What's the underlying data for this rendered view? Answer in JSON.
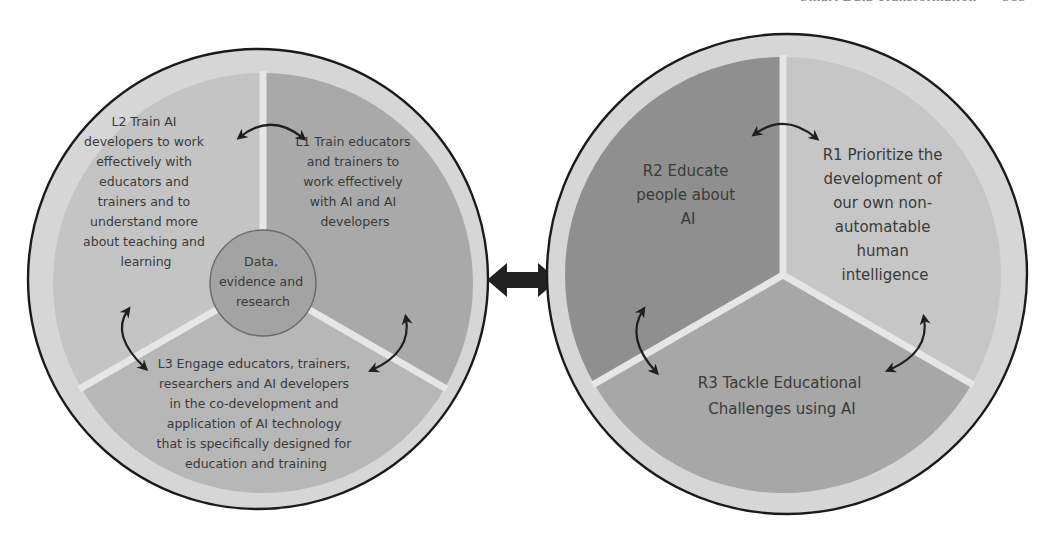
{
  "page_header": {
    "running_title": "Smart Data Transformation",
    "page_number": "315",
    "clipped": true
  },
  "colors": {
    "background": "#ffffff",
    "circle_outline": "#1a1a1a",
    "outer_ring": "#d6d6d6",
    "segment_divider": "#e6e6e6",
    "arrow": "#1f1f1f",
    "text": "#3a3a3a",
    "left_l1": "#a9a9a9",
    "left_l2": "#c4c4c4",
    "left_l3": "#b7b7b7",
    "left_center": "#a3a3a3",
    "right_r1": "#c6c6c6",
    "right_r2": "#8f8f8f",
    "right_r3": "#a7a7a7"
  },
  "left_circle": {
    "segments": [
      {
        "id": "L1",
        "lines": [
          "L1 Train educators",
          "and trainers to",
          "work effectively",
          "with AI and AI",
          "developers"
        ]
      },
      {
        "id": "L2",
        "lines": [
          "L2 Train AI",
          "developers to work",
          "effectively with",
          "educators and",
          "trainers and to",
          "understand more",
          "about teaching and",
          "learning"
        ]
      },
      {
        "id": "L3",
        "lines": [
          "L3 Engage educators, trainers,",
          "researchers and AI developers",
          "in the co-development and",
          "application of AI technology",
          "that is specifically designed for",
          "education and training"
        ]
      }
    ],
    "center": {
      "lines": [
        "Data,",
        "evidence and",
        "research"
      ]
    },
    "arrows": [
      {
        "between": [
          "L2",
          "L1"
        ],
        "direction": "bidirectional"
      },
      {
        "between": [
          "L2",
          "L3"
        ],
        "direction": "bidirectional"
      },
      {
        "between": [
          "L1",
          "L3"
        ],
        "direction": "bidirectional"
      }
    ]
  },
  "connector": {
    "type": "double-headed-arrow",
    "between": [
      "left_circle",
      "right_circle"
    ]
  },
  "right_circle": {
    "segments": [
      {
        "id": "R1",
        "lines": [
          "R1 Prioritize the",
          "development of",
          "our own non-",
          "automatable",
          "human",
          "intelligence"
        ]
      },
      {
        "id": "R2",
        "lines": [
          "R2 Educate",
          "people about",
          "AI"
        ]
      },
      {
        "id": "R3",
        "lines": [
          "R3 Tackle Educational",
          "Challenges using AI"
        ]
      }
    ],
    "arrows": [
      {
        "between": [
          "R2",
          "R1"
        ],
        "direction": "bidirectional"
      },
      {
        "between": [
          "R2",
          "R3"
        ],
        "direction": "bidirectional"
      },
      {
        "between": [
          "R1",
          "R3"
        ],
        "direction": "bidirectional"
      }
    ]
  }
}
